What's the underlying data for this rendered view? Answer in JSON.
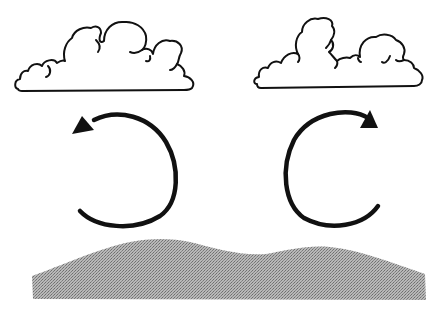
{
  "diagram": {
    "background_color": "#ffffff",
    "line_color": "#111111",
    "ground_color": "#a8a8a8",
    "elements": [
      {
        "id": "cloud-left",
        "type": "cumulus-cloud",
        "position": "top-left"
      },
      {
        "id": "cloud-right",
        "type": "cumulus-cloud",
        "position": "top-right"
      },
      {
        "id": "arrow-left",
        "type": "circular-arrow",
        "direction": "counter-clockwise",
        "position": "middle-left"
      },
      {
        "id": "arrow-right",
        "type": "circular-arrow",
        "direction": "clockwise",
        "position": "middle-right"
      },
      {
        "id": "ground",
        "type": "stippled-terrain",
        "position": "bottom"
      }
    ],
    "labels": []
  }
}
